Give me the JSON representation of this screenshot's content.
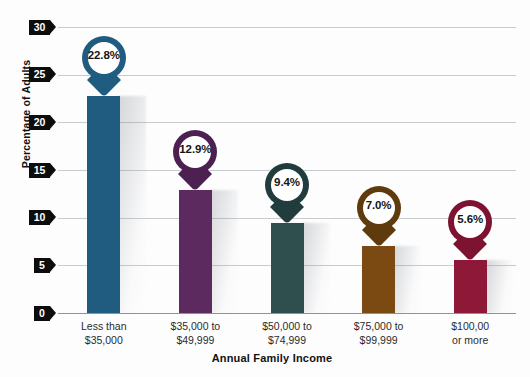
{
  "chart_data": {
    "type": "bar",
    "title": "",
    "xlabel": "Annual Family Income",
    "ylabel": "Percentage of Adults",
    "categories": [
      "Less than $35,000",
      "$35,000 to $49,999",
      "$50,000 to $74,999",
      "$75,000 to $99,999",
      "$100,000 or more"
    ],
    "category_lines": [
      [
        "Less than",
        "$35,000"
      ],
      [
        "$35,000 to",
        "$49,999"
      ],
      [
        "$50,000 to",
        "$74,999"
      ],
      [
        "$75,000 to",
        "$99,999"
      ],
      [
        "$100,00",
        "or more"
      ]
    ],
    "values": [
      22.8,
      12.9,
      9.4,
      7.0,
      5.6
    ],
    "value_labels": [
      "22.8%",
      "12.9%",
      "9.4%",
      "7.0%",
      "5.6%"
    ],
    "ylim": [
      0,
      30
    ],
    "yticks": [
      30,
      25,
      20,
      15,
      10,
      5,
      0
    ],
    "ytick_labels": [
      "30",
      "25",
      "20",
      "15",
      "10",
      "5",
      "0"
    ],
    "grid": true,
    "legend": "none",
    "bar_colors": [
      "#1f5c80",
      "#5d2a60",
      "#2f4f4f",
      "#7a4a12",
      "#8e1838"
    ],
    "pin_colors": [
      "#1f5c80",
      "#4c2152",
      "#203c3c",
      "#5e3a0d",
      "#7d1330"
    ],
    "grid_color": "#c8ccd0",
    "axis_color": "#8d9499",
    "background": "#fdfdfd",
    "tick_tag_color": "#0d0d0d",
    "tick_tag_text_color": "#ffffff"
  }
}
